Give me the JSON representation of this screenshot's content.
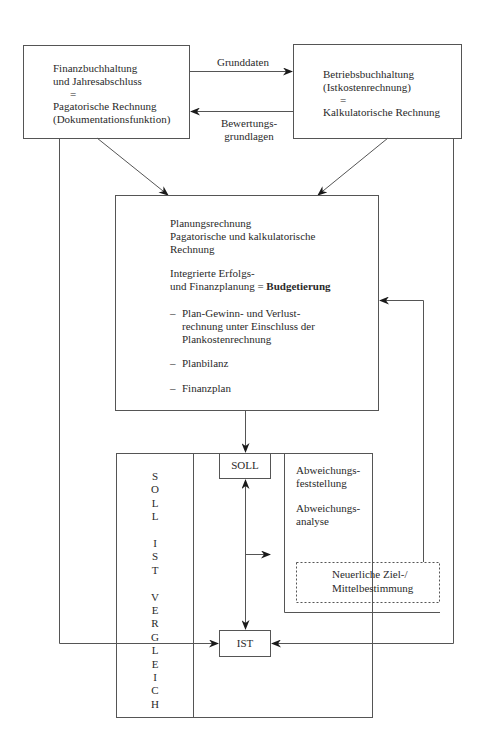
{
  "top_left_box": {
    "lines": [
      "Finanzbuchhaltung",
      "und Jahresabschluss",
      "=",
      "Pagatorische Rechnung",
      "(Dokumentationsfunktion)"
    ]
  },
  "top_right_box": {
    "lines": [
      "Betriebsbuchhaltung",
      "(Istkostenrechnung)",
      "=",
      "Kalkulatorische Rechnung"
    ]
  },
  "arrows": {
    "grunddaten": "Grunddaten",
    "bewertung_1": "Bewertungs-",
    "bewertung_2": "grundlagen"
  },
  "middle_box": {
    "title_1": "Planungsrechnung",
    "title_2": "Pagatorische und kalkulatorische",
    "title_3": "Rechnung",
    "integ_1": "Integrierte Erfolgs-",
    "integ_2_prefix": "und Finanzplanung = ",
    "integ_2_bold": "Budgetierung",
    "item1_dash": "–",
    "item1_l1": "Plan-Gewinn- und Verlust-",
    "item1_l2": "rechnung unter Einschluss der",
    "item1_l3": "Plankostenrechnung",
    "item2_dash": "–",
    "item2": "Planbilanz",
    "item3_dash": "–",
    "item3": "Finanzplan"
  },
  "bottom": {
    "vertical_letters": [
      "S",
      "O",
      "L",
      "L",
      "",
      "I",
      "S",
      "T",
      "",
      "V",
      "E",
      "R",
      "G",
      "L",
      "E",
      "I",
      "C",
      "H"
    ],
    "soll": "SOLL",
    "ist": "IST",
    "abw_1": "Abweichungs-",
    "abw_2": "feststellung",
    "abw_3": "Abweichungs-",
    "abw_4": "analyse",
    "neu_1": "Neuerliche Ziel-/",
    "neu_2": "Mittelbestimmung"
  }
}
